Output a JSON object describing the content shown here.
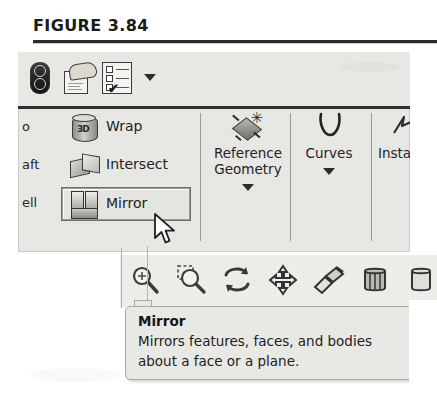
{
  "figure": {
    "caption": "FIGURE 3.84"
  },
  "quick_toolbar": {
    "icons": [
      {
        "name": "evaluate-icon",
        "glyph": "dual-circle-pill"
      },
      {
        "name": "hand-document-icon",
        "glyph": "hand-over-document"
      },
      {
        "name": "checklist-icon",
        "glyph": "checklist-with-check"
      }
    ],
    "checklist_check": "✔",
    "dropdown": {
      "name": "chevron-down-icon",
      "glyph": "▾"
    }
  },
  "ribbon": {
    "clipped_labels": [
      {
        "name": "clipped-label-dome",
        "text": "o"
      },
      {
        "name": "clipped-label-draft",
        "text": "aft"
      },
      {
        "name": "clipped-label-shell",
        "text": "ell"
      }
    ],
    "small_buttons": [
      {
        "name": "wrap-button",
        "label": "Wrap",
        "icon": "cylinder-wrap-icon",
        "icon_glyph": "3D",
        "highlighted": false
      },
      {
        "name": "intersect-button",
        "label": "Intersect",
        "icon": "intersect-solids-icon",
        "highlighted": false
      },
      {
        "name": "mirror-button",
        "label": "Mirror",
        "icon": "mirror-blocks-icon",
        "highlighted": true
      }
    ],
    "large_buttons": [
      {
        "name": "reference-geometry-button",
        "label_line1": "Reference",
        "label_line2": "Geometry",
        "icon": "reference-plane-icon",
        "star": "✳",
        "has_dropdown": true
      },
      {
        "name": "curves-button",
        "label_line1": "Curves",
        "label_line2": "",
        "icon": "spline-curve-icon",
        "has_dropdown": true
      },
      {
        "name": "instant3d-button",
        "label_line1": "Insta",
        "label_line2": "",
        "icon": "instant3d-icon",
        "has_dropdown": false
      }
    ]
  },
  "view_toolbar": {
    "icons": [
      {
        "name": "zoom-to-fit-icon"
      },
      {
        "name": "zoom-to-area-icon"
      },
      {
        "name": "rotate-view-icon"
      },
      {
        "name": "pan-view-icon"
      },
      {
        "name": "section-view-icon"
      },
      {
        "name": "display-style-icon"
      },
      {
        "name": "appearance-icon"
      }
    ]
  },
  "tooltip": {
    "title": "Mirror",
    "body": "Mirrors features, faces, and bodies about a face or a plane."
  },
  "cursor": {
    "name": "mouse-pointer",
    "x": 152,
    "y": 212
  },
  "colors": {
    "paper": "#ffffff",
    "ribbon_bg": "#e9e9e6",
    "tooltip_bg": "#e8e8e4",
    "text": "#232323",
    "rule": "#2b2b2b"
  }
}
